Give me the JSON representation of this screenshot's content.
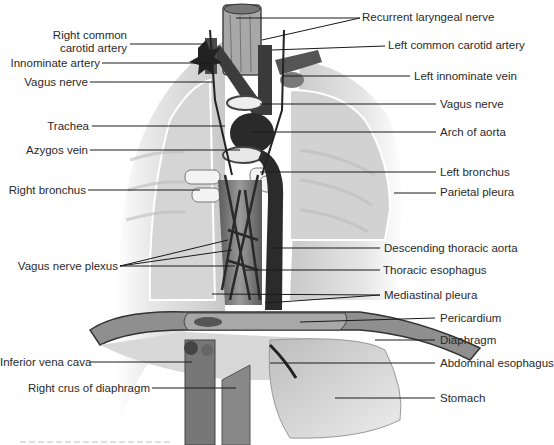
{
  "figure": {
    "left_labels": [
      {
        "id": "right-common-carotid-artery",
        "text_line1": "Right common",
        "text_line2": "carotid artery",
        "x": 0,
        "y": 30
      },
      {
        "id": "innominate-artery",
        "text": "Innominate artery",
        "y": 63
      },
      {
        "id": "vagus-nerve-right",
        "text": "Vagus nerve",
        "y": 82
      },
      {
        "id": "trachea",
        "text": "Trachea",
        "y": 125
      },
      {
        "id": "azygos-vein",
        "text": "Azygos vein",
        "y": 150
      },
      {
        "id": "right-bronchus",
        "text": "Right bronchus",
        "y": 190
      },
      {
        "id": "vagus-nerve-plexus",
        "text": "Vagus nerve plexus",
        "y": 266
      },
      {
        "id": "inferior-vena-cava",
        "text": "Inferior vena cava",
        "y": 362
      },
      {
        "id": "right-crus-of-diaphragm",
        "text": "Right crus of diaphragm",
        "y": 387
      }
    ],
    "right_labels": [
      {
        "id": "recurrent-laryngeal-nerve",
        "text": "Recurrent laryngeal nerve",
        "y": 18
      },
      {
        "id": "left-common-carotid-artery",
        "text": "Left common carotid artery",
        "y": 46
      },
      {
        "id": "left-innominate-vein",
        "text": "Left innominate vein",
        "y": 76
      },
      {
        "id": "vagus-nerve-left",
        "text": "Vagus nerve",
        "y": 104
      },
      {
        "id": "arch-of-aorta",
        "text": "Arch of aorta",
        "y": 132
      },
      {
        "id": "left-bronchus",
        "text": "Left bronchus",
        "y": 172
      },
      {
        "id": "parietal-pleura",
        "text": "Parietal pleura",
        "y": 192
      },
      {
        "id": "descending-thoracic-aorta",
        "text": "Descending thoracic aorta",
        "y": 248
      },
      {
        "id": "thoracic-esophagus",
        "text": "Thoracic esophagus",
        "y": 270
      },
      {
        "id": "mediastinal-pleura",
        "text": "Mediastinal pleura",
        "y": 295
      },
      {
        "id": "pericardium",
        "text": "Pericardium",
        "y": 318
      },
      {
        "id": "diaphragm",
        "text": "Diaphragm",
        "y": 340
      },
      {
        "id": "abdominal-esophagus",
        "text": "Abdominal esophagus",
        "y": 363
      },
      {
        "id": "stomach",
        "text": "Stomach",
        "y": 398
      }
    ],
    "colors": {
      "label_text": "#2a2a2a",
      "leader_line": "#1a1a1a",
      "pleura_fill": "#d9d9d9",
      "vessel_dark": "#3a3a3a",
      "esophagus": "#8a8a8a",
      "stomach": "#c8c8c8"
    }
  }
}
